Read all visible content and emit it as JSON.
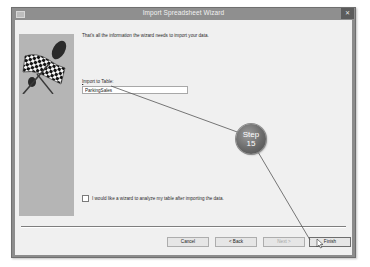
{
  "window": {
    "title": "Import Spreadsheet Wizard",
    "close_glyph": "✕",
    "icons": {
      "app": "window-icon",
      "close": "close-icon"
    }
  },
  "wizard": {
    "message": "That's all the information the wizard needs to import your data.",
    "import_label_prefix": "",
    "import_label_underlined": "I",
    "import_label_rest": "mport to Table:",
    "table_name": "ParkingSales",
    "analyze_checkbox": {
      "label": "I would like a wizard to analyze my table after importing the data.",
      "checked": false
    },
    "side_image": "checkered-flag-icon"
  },
  "buttons": {
    "cancel": "Cancel",
    "back": "< Back",
    "next": "Next >",
    "finish": "Finish",
    "next_enabled": false
  },
  "callout": {
    "line1": "Step",
    "line2": "15",
    "colors": {
      "fill": "#6a6a6a",
      "text": "#ffffff",
      "line": "#555555"
    }
  }
}
